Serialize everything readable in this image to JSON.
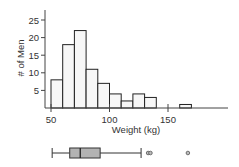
{
  "chart_data": [
    {
      "type": "bar",
      "subtype": "histogram",
      "title": "",
      "xlabel": "Weight (kg)",
      "ylabel": "# of Men",
      "bin_width": 10,
      "bins": [
        {
          "start": 50,
          "end": 60,
          "count": 8
        },
        {
          "start": 60,
          "end": 70,
          "count": 18
        },
        {
          "start": 70,
          "end": 80,
          "count": 22
        },
        {
          "start": 80,
          "end": 90,
          "count": 11
        },
        {
          "start": 90,
          "end": 100,
          "count": 7
        },
        {
          "start": 100,
          "end": 110,
          "count": 4
        },
        {
          "start": 110,
          "end": 120,
          "count": 2
        },
        {
          "start": 120,
          "end": 130,
          "count": 4
        },
        {
          "start": 130,
          "end": 140,
          "count": 3
        },
        {
          "start": 140,
          "end": 150,
          "count": 0
        },
        {
          "start": 150,
          "end": 160,
          "count": 0
        },
        {
          "start": 160,
          "end": 170,
          "count": 1
        }
      ],
      "xticks": [
        50,
        100,
        150
      ],
      "yticks": [
        5,
        10,
        15,
        20,
        25
      ],
      "xlim": [
        45,
        200
      ],
      "ylim": [
        0,
        28
      ],
      "grid": false,
      "bar_fill": "#f7f7f7",
      "bar_stroke": "#222222"
    },
    {
      "type": "boxplot",
      "orientation": "horizontal",
      "xlim": [
        45,
        200
      ],
      "whisker_low": 51,
      "q1": 66,
      "median": 75,
      "q3": 92,
      "whisker_high": 127,
      "outliers": [
        133,
        135,
        167
      ],
      "box_fill": "#b3b3b3",
      "stroke": "#333333"
    }
  ],
  "labels": {
    "ylabel": "# of Men",
    "xlabel": "Weight (kg)",
    "xticks": [
      "50",
      "100",
      "150"
    ],
    "yticks": [
      "5",
      "10",
      "15",
      "20",
      "25"
    ]
  }
}
